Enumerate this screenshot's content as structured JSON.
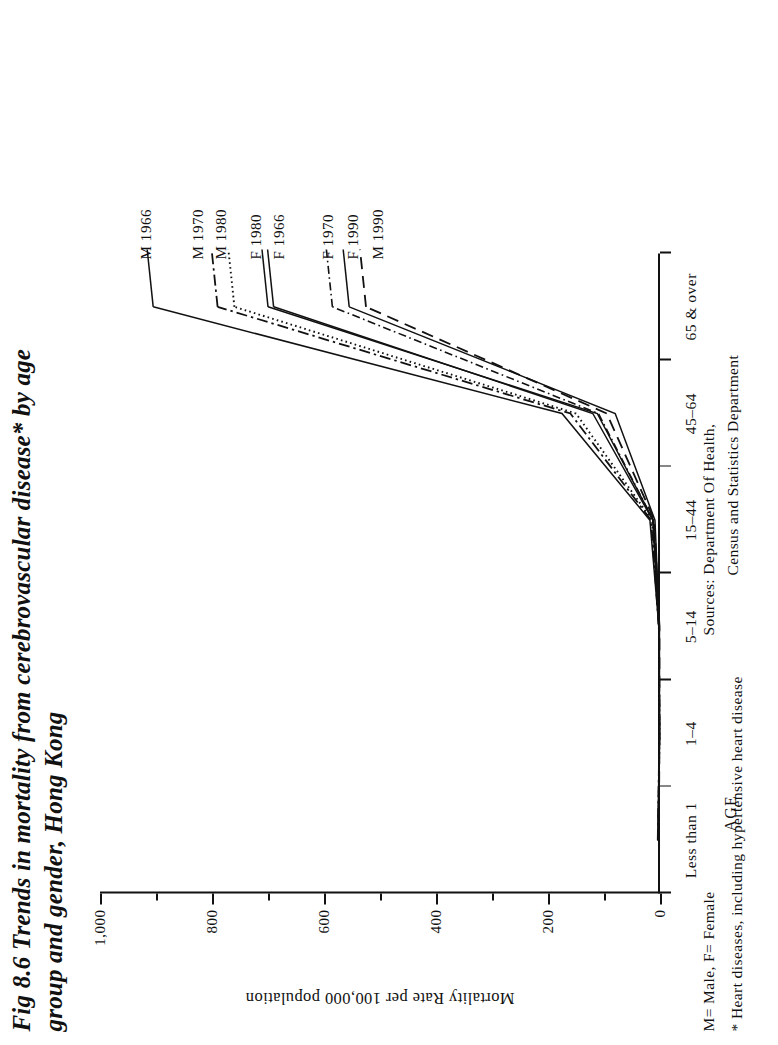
{
  "figure": {
    "title_line1": "Fig 8.6  Trends in mortality from cerebrovascular disease* by age",
    "title_line2": "group and gender, Hong Kong"
  },
  "axes": {
    "y_title": "Mortality Rate per 100,000 population",
    "y_ticks": [
      "0",
      "200",
      "400",
      "600",
      "800",
      "1,000"
    ],
    "x_title": "AGE",
    "x_categories": [
      "Less than 1",
      "1–4",
      "5–14",
      "15–44",
      "45–64",
      "65 & over"
    ]
  },
  "legend": {
    "items": [
      {
        "label": "M 1966",
        "style": "solid"
      },
      {
        "label": "M 1970",
        "style": "dash-dot"
      },
      {
        "label": "M 1980",
        "style": "dotted"
      },
      {
        "label": "F 1980",
        "style": "solid"
      },
      {
        "label": "F 1966",
        "style": "solid"
      },
      {
        "label": "F 1970",
        "style": "dash-dot-fine"
      },
      {
        "label": "F 1990",
        "style": "solid"
      },
      {
        "label": "M 1990",
        "style": "dashed"
      }
    ]
  },
  "notes": {
    "gender_key": "M= Male,  F= Female",
    "footnote": "* Heart diseases, including hypertensive heart disease",
    "sources_line1": "Sources: Department Of Health,",
    "sources_line2": "Census and Statistics Department"
  },
  "chart_data": {
    "type": "line",
    "title": "Fig 8.6  Trends in mortality from cerebrovascular disease* by age group and gender, Hong Kong",
    "xlabel": "AGE",
    "ylabel": "Mortality Rate per 100,000 population",
    "ylim": [
      0,
      1000
    ],
    "grid": false,
    "legend_position": "inline-right-end-of-lines",
    "categories": [
      "Less than 1",
      "1–4",
      "5–14",
      "15–44",
      "45–64",
      "65 & over"
    ],
    "series": [
      {
        "name": "M 1966",
        "style": "solid",
        "values": [
          4,
          1,
          2,
          18,
          175,
          905
        ]
      },
      {
        "name": "M 1970",
        "style": "dash-dot",
        "values": [
          4,
          1,
          2,
          16,
          160,
          790
        ]
      },
      {
        "name": "M 1980",
        "style": "dotted",
        "values": [
          3,
          1,
          2,
          14,
          150,
          760
        ]
      },
      {
        "name": "F 1980",
        "style": "solid",
        "values": [
          3,
          1,
          2,
          12,
          112,
          700
        ]
      },
      {
        "name": "F 1966",
        "style": "solid",
        "values": [
          3,
          1,
          2,
          13,
          120,
          690
        ]
      },
      {
        "name": "F 1970",
        "style": "dash-dot-fine",
        "values": [
          3,
          1,
          2,
          12,
          110,
          585
        ]
      },
      {
        "name": "F 1990",
        "style": "solid",
        "values": [
          2,
          1,
          1,
          9,
          80,
          555
        ]
      },
      {
        "name": "M 1990",
        "style": "dashed",
        "values": [
          2,
          1,
          1,
          10,
          95,
          525
        ]
      }
    ]
  }
}
